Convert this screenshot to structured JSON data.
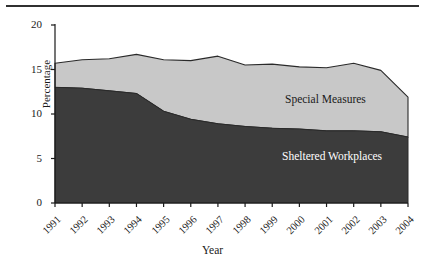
{
  "chart_data": {
    "type": "area",
    "stacked": true,
    "title": "",
    "subtitle": "",
    "xlabel": "Year",
    "ylabel": "Percentage",
    "categories": [
      "1991",
      "1992",
      "1993",
      "1994",
      "1995",
      "1996",
      "1997",
      "1998",
      "1999",
      "2000",
      "2001",
      "2002",
      "2003",
      "2004"
    ],
    "x": [
      1991,
      1992,
      1993,
      1994,
      1995,
      1996,
      1997,
      1998,
      1999,
      2000,
      2001,
      2002,
      2003,
      2004
    ],
    "ylim": [
      0,
      20
    ],
    "yticks": [
      0,
      5,
      10,
      15,
      20
    ],
    "ytick_labels": [
      "0",
      "5",
      "10",
      "15",
      "20"
    ],
    "grid": false,
    "legend_position": "inline-annotations",
    "series": [
      {
        "name": "Sheltered Workplaces",
        "color": "#3c3c3c",
        "values": [
          13.0,
          12.9,
          12.6,
          12.3,
          10.3,
          9.4,
          8.9,
          8.6,
          8.4,
          8.3,
          8.1,
          8.1,
          8.0,
          7.4
        ]
      },
      {
        "name": "Special Measures",
        "color": "#c8c8c8",
        "values": [
          2.7,
          3.2,
          3.6,
          4.4,
          5.8,
          6.6,
          7.6,
          6.9,
          7.2,
          7.0,
          7.1,
          7.6,
          6.9,
          4.5
        ]
      }
    ],
    "totals": [
      15.7,
      16.1,
      16.2,
      16.7,
      16.1,
      16.0,
      16.5,
      15.5,
      15.6,
      15.3,
      15.2,
      15.7,
      14.9,
      11.9
    ],
    "annotations": [
      {
        "text": "Special Measures",
        "series": "Special Measures"
      },
      {
        "text": "Sheltered Workplaces",
        "series": "Sheltered Workplaces"
      }
    ],
    "colors": {
      "sheltered_workplaces": "#3c3c3c",
      "special_measures": "#c8c8c8",
      "axis": "#1a1a1a",
      "outline": "#2a2a2a",
      "background": "#ffffff"
    }
  },
  "axes": {
    "y_label": "Percentage",
    "x_label": "Year"
  }
}
